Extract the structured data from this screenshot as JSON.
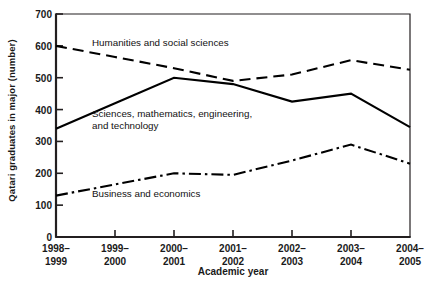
{
  "chart_data": {
    "type": "line",
    "title": "",
    "xlabel": "Academic year",
    "ylabel": "Qatari graduates in major (number)",
    "categories": [
      "1998–\n1999",
      "1999–\n2000",
      "2000–\n2001",
      "2001–\n2002",
      "2002–\n2003",
      "2003–\n2004",
      "2004–\n2005"
    ],
    "ylim": [
      0,
      700
    ],
    "yticks": [
      0,
      100,
      200,
      300,
      400,
      500,
      600,
      700
    ],
    "ytick_labels": [
      "0",
      "100",
      "200",
      "300",
      "400",
      "500",
      "600",
      "700"
    ],
    "grid": false,
    "legend_position": "inline-annotations",
    "series": [
      {
        "name": "Humanities and social sciences",
        "style": "dashed",
        "color": "#000000",
        "values": [
          600,
          565,
          530,
          490,
          510,
          555,
          525
        ]
      },
      {
        "name": "Sciences, mathematics, engineering, and technology",
        "style": "solid",
        "color": "#000000",
        "values": [
          340,
          420,
          500,
          480,
          425,
          450,
          345
        ]
      },
      {
        "name": "Business and economics",
        "style": "dash-dot",
        "color": "#000000",
        "values": [
          130,
          165,
          200,
          195,
          240,
          290,
          230
        ]
      }
    ],
    "annotations": [
      {
        "text": "Humanities and social sciences",
        "x_px": 92,
        "y_px": 37
      },
      {
        "text": "Sciences, mathematics, engineering,\nand technology",
        "x_px": 92,
        "y_px": 108
      },
      {
        "text": "Business and economics",
        "x_px": 92,
        "y_px": 188
      }
    ]
  },
  "axes": {
    "frame_color": "#231f20",
    "tick_color": "#231f20"
  }
}
